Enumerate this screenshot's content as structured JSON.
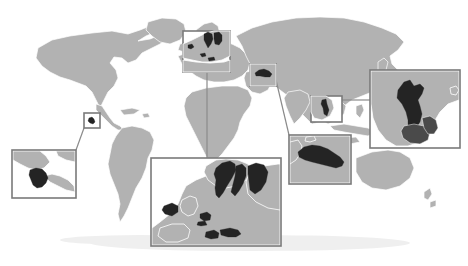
{
  "figure": {
    "kind": "world-map-with-magnified-insets",
    "title": "",
    "caption": "",
    "background_color": "#ffffff"
  },
  "palette": {
    "ocean": "#ffffff",
    "land": "#b2b2b2",
    "land_border": "#ffffff",
    "highlight_country": "#242424",
    "secondary_country": "#4a4a4a",
    "inset_border": "#7a7a7a",
    "leader_line": "#8a8a8a",
    "drop_shadow": "#efefef"
  },
  "basemap": {
    "name": "world-basemap",
    "projection_hint": "equirectangular",
    "bounds": {
      "x": 8,
      "y": 14,
      "width": 452,
      "height": 232
    }
  },
  "highlighted_regions": [
    {
      "id": "costa-rica",
      "label": "Costa Rica",
      "continent": "North America"
    },
    {
      "id": "iceland",
      "label": "Iceland",
      "continent": "Europe"
    },
    {
      "id": "norway",
      "label": "Norway",
      "continent": "Europe"
    },
    {
      "id": "sweden",
      "label": "Sweden",
      "continent": "Europe"
    },
    {
      "id": "finland",
      "label": "Finland",
      "continent": "Europe"
    },
    {
      "id": "netherlands",
      "label": "Netherlands",
      "continent": "Europe"
    },
    {
      "id": "belgium",
      "label": "Belgium",
      "continent": "Europe"
    },
    {
      "id": "switzerland",
      "label": "Switzerland",
      "continent": "Europe"
    },
    {
      "id": "austria",
      "label": "Austria",
      "continent": "Europe"
    },
    {
      "id": "turkmenistan",
      "label": "Turkmenistan",
      "continent": "Asia"
    },
    {
      "id": "laos",
      "label": "Laos",
      "continent": "Asia"
    }
  ],
  "insets": [
    {
      "id": "inset-costa-rica",
      "name": "costa-rica-inset",
      "subject": "Costa Rica",
      "frame": {
        "x": 12,
        "y": 150,
        "width": 64,
        "height": 48
      },
      "locator": {
        "x": 84,
        "y": 113,
        "width": 16,
        "height": 15
      },
      "leader": {
        "x1": 84,
        "y1": 128,
        "x2": 76,
        "y2": 150
      }
    },
    {
      "id": "inset-europe-large",
      "name": "europe-large-inset",
      "subject": "Northern and Central Europe",
      "frame": {
        "x": 151,
        "y": 158,
        "width": 130,
        "height": 88
      },
      "locator": {
        "x": 183,
        "y": 31,
        "width": 47,
        "height": 41
      },
      "leader": {
        "x1": 207,
        "y1": 72,
        "x2": 207,
        "y2": 158
      }
    },
    {
      "id": "inset-scandinavia-locator",
      "name": "scandinavia-locator-box",
      "subject": "Scandinavia",
      "frame": {
        "x": 183,
        "y": 31,
        "width": 47,
        "height": 41
      },
      "locator": null,
      "leader": null
    },
    {
      "id": "inset-turkmenistan-large",
      "name": "turkmenistan-large-inset",
      "subject": "Turkmenistan",
      "frame": {
        "x": 289,
        "y": 135,
        "width": 62,
        "height": 49
      },
      "locator": {
        "x": 250,
        "y": 64,
        "width": 26,
        "height": 22
      },
      "leader": {
        "x1": 276,
        "y1": 78,
        "x2": 289,
        "y2": 135
      }
    },
    {
      "id": "inset-laos-large",
      "name": "laos-large-inset",
      "subject": "Laos",
      "frame": {
        "x": 370,
        "y": 70,
        "width": 90,
        "height": 78
      },
      "locator": {
        "x": 311,
        "y": 96,
        "width": 31,
        "height": 26
      },
      "leader": {
        "x1": 342,
        "y1": 99,
        "x2": 370,
        "y2": 99
      }
    }
  ],
  "locator_boxes": [
    {
      "id": "loc-costa-rica",
      "name": "costa-rica-locator",
      "x": 84,
      "y": 113,
      "width": 16,
      "height": 15
    },
    {
      "id": "loc-scandinavia",
      "name": "scandinavia-locator",
      "x": 183,
      "y": 31,
      "width": 47,
      "height": 41
    },
    {
      "id": "loc-turkmenistan",
      "name": "turkmenistan-locator",
      "x": 250,
      "y": 64,
      "width": 26,
      "height": 22
    },
    {
      "id": "loc-laos",
      "name": "laos-locator",
      "x": 311,
      "y": 96,
      "width": 31,
      "height": 26
    }
  ],
  "annotations": {
    "legend": null,
    "scale_bar": null,
    "north_arrow": null,
    "labels": []
  }
}
